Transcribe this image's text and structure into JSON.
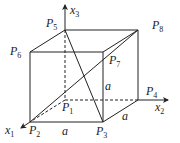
{
  "diagram": {
    "type": "cube-coordinate-diagram",
    "stroke_color": "#222222",
    "vertices": {
      "P1": {
        "base": "P",
        "sub": "1",
        "x": 65,
        "y": 100
      },
      "P2": {
        "base": "P",
        "sub": "2",
        "x": 30,
        "y": 122
      },
      "P3": {
        "base": "P",
        "sub": "3",
        "x": 103,
        "y": 122
      },
      "P4": {
        "base": "P",
        "sub": "4",
        "x": 138,
        "y": 100
      },
      "P5": {
        "base": "P",
        "sub": "5",
        "x": 65,
        "y": 30
      },
      "P6": {
        "base": "P",
        "sub": "6",
        "x": 30,
        "y": 52
      },
      "P7": {
        "base": "P",
        "sub": "7",
        "x": 103,
        "y": 52
      },
      "P8": {
        "base": "P",
        "sub": "8",
        "x": 138,
        "y": 30
      }
    },
    "axes": {
      "x1": {
        "base": "x",
        "sub": "1"
      },
      "x2": {
        "base": "x",
        "sub": "2"
      },
      "x3": {
        "base": "x",
        "sub": "3"
      }
    },
    "edge_labels": {
      "front_vertical": "a",
      "front_bottom": "a",
      "right_depth": "a"
    }
  }
}
